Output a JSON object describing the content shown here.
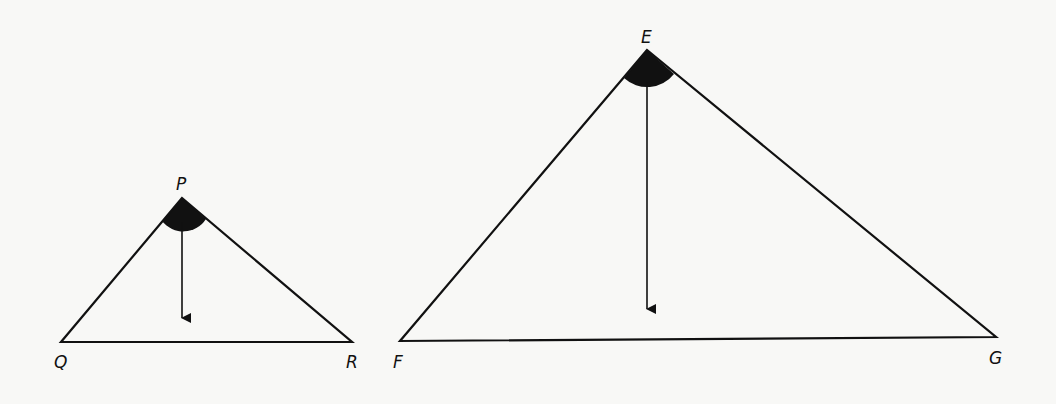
{
  "diagram": {
    "title": "",
    "colors": {
      "stroke": "#111111",
      "background": "#f8f8f6",
      "angle_fill": "#111111"
    },
    "triangles": [
      {
        "name": "PQR",
        "vertices": {
          "P": {
            "label": "P",
            "x": 182,
            "y": 198
          },
          "Q": {
            "label": "Q",
            "x": 61,
            "y": 342
          },
          "R": {
            "label": "R",
            "x": 352,
            "y": 342
          }
        },
        "apex": "P",
        "arrow": {
          "from_y": 222,
          "to_y": 318
        }
      },
      {
        "name": "EFG",
        "vertices": {
          "E": {
            "label": "E",
            "x": 647,
            "y": 50
          },
          "F": {
            "label": "F",
            "x": 400,
            "y": 341
          },
          "G": {
            "label": "G",
            "x": 996,
            "y": 337
          }
        },
        "apex": "E",
        "arrow": {
          "from_y": 82,
          "to_y": 309
        }
      }
    ]
  }
}
